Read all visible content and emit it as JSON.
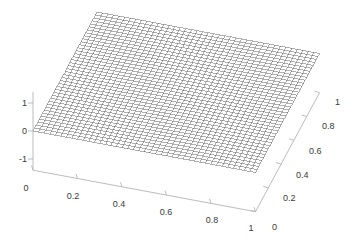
{
  "figure": {
    "background_color": "#ffffff",
    "width": 359,
    "height": 247
  },
  "chart_data": {
    "type": "surface",
    "render_style": "mesh-wireframe",
    "title": "",
    "xlabel": "",
    "ylabel": "",
    "zlabel": "",
    "grid": false,
    "legend": null,
    "xlim": [
      0,
      1
    ],
    "ylim": [
      0,
      1
    ],
    "zlim": [
      -1.4,
      1.4
    ],
    "x_ticks": [
      "0",
      "0.2",
      "0.4",
      "0.6",
      "0.8",
      "1"
    ],
    "x_tick_values": [
      0,
      0.2,
      0.4,
      0.6,
      0.8,
      1
    ],
    "y_ticks": [
      "0",
      "0.2",
      "0.4",
      "0.6",
      "0.8",
      "1"
    ],
    "y_tick_values": [
      0,
      0.2,
      0.4,
      0.6,
      0.8,
      1
    ],
    "z_ticks": [
      "1",
      "0",
      "-1"
    ],
    "z_tick_values": [
      1,
      0,
      -1
    ],
    "grid_divisions": 40,
    "surface": {
      "description": "near-planar tilted sheet rising from z=0 at the x=0,y=0 corner",
      "z_corner_x0_y0": 0.0,
      "z_corner_x1_y0": 0.0,
      "z_corner_x0_y1": 0.0,
      "z_corner_x1_y1": 0.0,
      "z_min": 0.0,
      "z_max": 0.05,
      "edge_color": "#4d4d4d",
      "face_color": "#ffffff"
    },
    "view": {
      "azimuth": -37.5,
      "elevation": 30
    },
    "axis_color": "#b4b4b4",
    "tick_text_color": "#3a3a3a"
  },
  "axes": {
    "x_axis_name": "x-axis",
    "y_axis_name": "y-axis",
    "z_axis_name": "z-axis"
  }
}
